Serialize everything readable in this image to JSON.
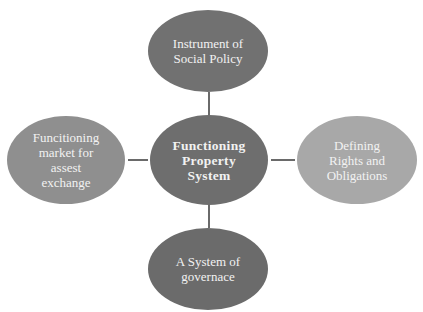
{
  "diagram": {
    "type": "hub-and-spoke",
    "center": {
      "label": "Functioning\nProperty\nSystem"
    },
    "nodes": {
      "top": {
        "label": "Instrument of\nSocial Policy"
      },
      "right": {
        "label": "Defining\nRights and\nObligations"
      },
      "bottom": {
        "label": "A System of\ngovernace"
      },
      "left": {
        "label": "Funcitioning\nmarket for\nassest\nexchange"
      }
    },
    "colors": {
      "center": "#6e6e6e",
      "top": "#717171",
      "bottom": "#6b6b6b",
      "left": "#8f8f8f",
      "right": "#a8a8a8",
      "text": "#f2f2f2",
      "connector": "#6a6a6a"
    }
  }
}
